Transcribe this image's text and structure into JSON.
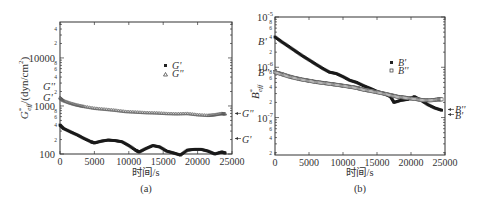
{
  "chart_data": [
    {
      "panel": "(a)",
      "type": "scatter",
      "xlabel": "时间/s",
      "ylabel": "G*eff/(dyn/cm²)",
      "ylabel_main": "G",
      "ylabel_super": "*",
      "ylabel_sub": "eff",
      "ylabel_rest": "/(dyn/cm",
      "ylabel_exp": "2",
      "ylabel_close": ")",
      "xlim": [
        0,
        25000
      ],
      "ylim": [
        100,
        56000
      ],
      "yscale": "log",
      "x_ticks": [
        0,
        5000,
        10000,
        15000,
        20000,
        25000
      ],
      "x_tick_labels": [
        "0",
        "5000",
        "10000",
        "15000",
        "20000",
        "25000"
      ],
      "y_major_ticks": [
        100,
        1000,
        10000
      ],
      "y_major_labels": [
        "100",
        "1000",
        "10000"
      ],
      "y_minor_labels": [
        {
          "value": 200,
          "label": "2"
        },
        {
          "value": 400,
          "label": "4"
        },
        {
          "value": 600,
          "label": "6"
        },
        {
          "value": 800,
          "label": "8"
        },
        {
          "value": 2000,
          "label": "2"
        },
        {
          "value": 4000,
          "label": "4"
        },
        {
          "value": 6000,
          "label": "6"
        },
        {
          "value": 8000,
          "label": "8"
        },
        {
          "value": 20000,
          "label": "2"
        },
        {
          "value": 40000,
          "label": "4"
        }
      ],
      "left_annotations": [
        {
          "label": "G''",
          "value": 2600
        },
        {
          "label": "G'",
          "value": 1550
        }
      ],
      "right_annotations": [
        {
          "label": "G''",
          "value": 700
        },
        {
          "label": "G'",
          "value": 210
        }
      ],
      "legend": [
        {
          "label": "G'",
          "marker": "filled-square"
        },
        {
          "label": "G''",
          "marker": "open-triangle"
        }
      ],
      "legend_position": "upper right inside",
      "grid": false,
      "series": [
        {
          "name": "G'",
          "marker": "filled-square",
          "x": [
            0,
            500,
            1500,
            2500,
            3500,
            4500,
            5000,
            6000,
            7000,
            8000,
            9000,
            10000,
            11000,
            11500,
            12500,
            13500,
            14500,
            15500,
            16500,
            17500,
            18500,
            19500,
            20500,
            21500,
            22500,
            23500,
            24000
          ],
          "y": [
            400,
            340,
            290,
            250,
            210,
            180,
            170,
            185,
            195,
            190,
            180,
            150,
            120,
            110,
            130,
            150,
            140,
            115,
            105,
            95,
            120,
            125,
            125,
            115,
            100,
            110,
            105
          ]
        },
        {
          "name": "G''",
          "marker": "open-triangle",
          "x": [
            0,
            500,
            1500,
            2500,
            3500,
            5000,
            6500,
            8000,
            9500,
            11000,
            12500,
            14000,
            15500,
            17000,
            18500,
            20000,
            21500,
            22500,
            23500,
            24000
          ],
          "y": [
            1500,
            1300,
            1150,
            1050,
            980,
            900,
            860,
            820,
            770,
            750,
            730,
            720,
            700,
            690,
            700,
            660,
            640,
            660,
            700,
            690
          ]
        }
      ]
    },
    {
      "panel": "(b)",
      "type": "scatter",
      "xlabel": "时间/s",
      "ylabel": "B*eff",
      "ylabel_main": "B",
      "ylabel_super": "*",
      "ylabel_sub": "eff",
      "xlim": [
        0,
        25000
      ],
      "ylim": [
        1.8e-08,
        1e-05
      ],
      "yscale": "log",
      "x_ticks": [
        0,
        5000,
        10000,
        15000,
        20000,
        25000
      ],
      "x_tick_labels": [
        "0",
        "5000",
        "10000",
        "15000",
        "20000",
        "25000"
      ],
      "y_major_ticks": [
        1e-07,
        1e-06,
        1e-05
      ],
      "y_major_labels": [
        {
          "base": "10",
          "exp": "-7"
        },
        {
          "base": "10",
          "exp": "-6"
        },
        {
          "base": "10",
          "exp": "-5"
        }
      ],
      "y_minor_labels": [
        {
          "value": 2e-08,
          "label": "2"
        },
        {
          "value": 4e-08,
          "label": "4"
        },
        {
          "value": 6e-08,
          "label": "6"
        },
        {
          "value": 8e-08,
          "label": "8"
        },
        {
          "value": 2e-07,
          "label": "2"
        },
        {
          "value": 4e-07,
          "label": "4"
        },
        {
          "value": 6e-07,
          "label": "6"
        },
        {
          "value": 8e-07,
          "label": "8"
        },
        {
          "value": 2e-06,
          "label": "2"
        },
        {
          "value": 4e-06,
          "label": "4"
        },
        {
          "value": 6e-06,
          "label": "6"
        },
        {
          "value": 8e-06,
          "label": "8"
        }
      ],
      "left_annotations": [
        {
          "label": "B'",
          "value": 3.3e-06
        },
        {
          "label": "B''",
          "value": 8e-07
        }
      ],
      "right_annotations": [
        {
          "label": "B''",
          "value": 1.45e-07
        },
        {
          "label": "B'",
          "value": 1.15e-07
        }
      ],
      "legend": [
        {
          "label": "B'",
          "marker": "filled-square"
        },
        {
          "label": "B''",
          "marker": "open-square"
        }
      ],
      "legend_position": "upper right inside",
      "grid": false,
      "series": [
        {
          "name": "B'",
          "marker": "filled-square",
          "x": [
            0,
            1000,
            2000,
            3000,
            4000,
            5000,
            6000,
            7000,
            8000,
            9000,
            10000,
            11000,
            12000,
            13000,
            14000,
            15000,
            16000,
            17000,
            17500,
            18500,
            19500,
            20500,
            21500,
            22500,
            23500,
            24500
          ],
          "y": [
            4e-06,
            3.2e-06,
            2.6e-06,
            2.1e-06,
            1.7e-06,
            1.4e-06,
            1.15e-06,
            9.5e-07,
            8e-07,
            7.5e-07,
            6.5e-07,
            5.5e-07,
            5e-07,
            4.3e-07,
            3.8e-07,
            3.3e-07,
            3e-07,
            2.6e-07,
            2e-07,
            2.2e-07,
            2.3e-07,
            2.6e-07,
            2.2e-07,
            1.8e-07,
            1.55e-07,
            1.4e-07
          ]
        },
        {
          "name": "B''",
          "marker": "open-square",
          "x": [
            0,
            1000,
            2000,
            3000,
            4000,
            5000,
            6000,
            7000,
            8000,
            9000,
            10000,
            11000,
            12000,
            13000,
            14000,
            15000,
            16000,
            17000,
            18000,
            19000,
            20000,
            21000,
            22000,
            23000,
            24000,
            24500
          ],
          "y": [
            8e-07,
            7.3e-07,
            6.6e-07,
            6.1e-07,
            5.7e-07,
            5.4e-07,
            5.1e-07,
            4.9e-07,
            4.7e-07,
            4.5e-07,
            4.3e-07,
            4.1e-07,
            3.9e-07,
            3.6e-07,
            3.4e-07,
            3.2e-07,
            3e-07,
            2.8e-07,
            2.6e-07,
            2.5e-07,
            2.4e-07,
            2.3e-07,
            2.2e-07,
            2.2e-07,
            2.3e-07,
            2.3e-07
          ]
        }
      ]
    }
  ]
}
